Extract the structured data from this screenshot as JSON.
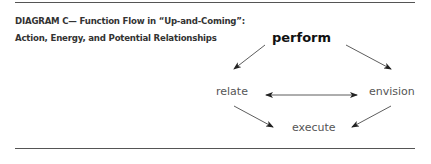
{
  "diagram": {
    "title_line1": "DIAGRAM C— Function Flow in “Up-and-Coming”:",
    "title_line2": "Action, Energy, and Potential Relationships",
    "nodes": {
      "perform": "perform",
      "relate": "relate",
      "envision": "envision",
      "execute": "execute"
    },
    "edges": [
      {
        "from": "perform",
        "to": "relate",
        "direction": "one-way"
      },
      {
        "from": "perform",
        "to": "envision",
        "direction": "one-way"
      },
      {
        "from": "relate",
        "to": "envision",
        "direction": "two-way"
      },
      {
        "from": "relate",
        "to": "execute",
        "direction": "one-way"
      },
      {
        "from": "envision",
        "to": "execute",
        "direction": "one-way"
      }
    ]
  }
}
